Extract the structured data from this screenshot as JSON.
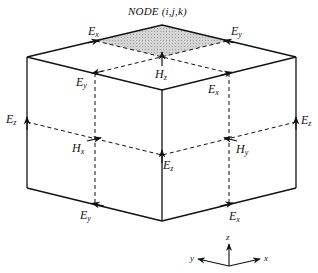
{
  "title": "NODE (i,j,k)",
  "labels": {
    "top_ex": {
      "main": "E",
      "sub": "x"
    },
    "top_ey": {
      "main": "E",
      "sub": "y"
    },
    "hz": {
      "main": "H",
      "sub": "z"
    },
    "mid_ey": {
      "main": "E",
      "sub": "y"
    },
    "mid_ex": {
      "main": "E",
      "sub": "x"
    },
    "left_ez": {
      "main": "E",
      "sub": "z"
    },
    "right_ez": {
      "main": "E",
      "sub": "z"
    },
    "hx": {
      "main": "H",
      "sub": "x"
    },
    "center_ez": {
      "main": "E",
      "sub": "z"
    },
    "hy": {
      "main": "H",
      "sub": "y"
    },
    "bottom_ey": {
      "main": "E",
      "sub": "y"
    },
    "bottom_ex": {
      "main": "E",
      "sub": "x"
    }
  },
  "axes": {
    "z": "z",
    "y": "y",
    "x": "x"
  },
  "colors": {
    "stroke": "#111111",
    "shade": "#c8c8c8"
  }
}
